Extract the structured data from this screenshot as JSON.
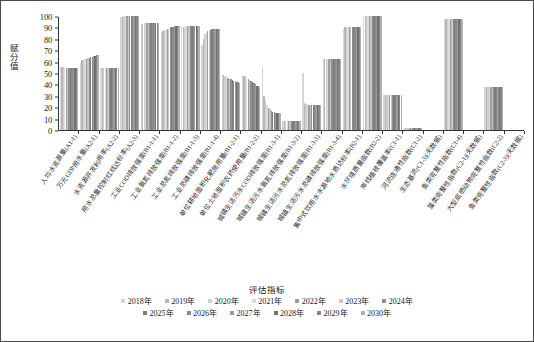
{
  "chart_data": {
    "type": "bar",
    "title": "",
    "xlabel": "评估指标",
    "ylabel": "赋分值",
    "ylim": [
      0,
      100
    ],
    "yticks": [
      0,
      10,
      20,
      30,
      40,
      50,
      60,
      70,
      80,
      90,
      100
    ],
    "grid": false,
    "legend_title": "评估指标",
    "legend_position": "bottom",
    "categories": [
      "人均水资源量(A1-1)",
      "万元GDP用水量(A2-1)",
      "水资源开发利用率(A2-2)",
      "用水总量控制红线达标率(A2-3)",
      "工业COD排放强度(B1-1-1)",
      "工业氨氮排放强度(B1-1-2)",
      "工业总氮排放强度(B1-1-3)",
      "工业总磷排放强度(B1-1-4)",
      "单位耕地面积化肥施用量(B1-2-1)",
      "单位土地面积农药使用量(B1-2-2)",
      "城镇生活污水COD排放强度(B1-3-1)",
      "城镇生活污水氨氮排放强度(B1-3-2)",
      "城镇生活污水总氮排放强度(B1-3-3)",
      "城镇生活污水总磷排放强度(B1-3-4)",
      "集中式饮用水水源地水质达标率(B2-1)",
      "水环境质量指数(B2-2)",
      "岸线植被覆盖率(C1-1)",
      "河流连通性指数(C1-2)",
      "生态基流(C1-3)(无数据)",
      "鱼类完整性指数(C1-4)",
      "藻类完整性指数(C2-1)(无数据)",
      "大型底栖动物完整性指数(C2-2)",
      "鱼类完整性指数(C2-3)(无数据)"
    ],
    "series": [
      {
        "name": "2018年",
        "color": "#d6d6d6",
        "values": [
          55,
          60,
          54,
          99,
          93,
          86,
          90,
          75,
          48,
          48,
          55,
          8,
          50,
          62,
          89,
          99,
          31,
          2,
          0,
          97,
          0,
          38,
          0
        ]
      },
      {
        "name": "2019年",
        "color": "#b8b8b8",
        "values": [
          55,
          61,
          54,
          99,
          93,
          87,
          90,
          80,
          48,
          47,
          30,
          8,
          24,
          62,
          90,
          100,
          31,
          2,
          0,
          97,
          0,
          38,
          0
        ]
      },
      {
        "name": "2020年",
        "color": "#cfcfcf",
        "values": [
          55,
          61,
          54,
          100,
          94,
          88,
          90,
          84,
          47,
          47,
          26,
          8,
          23,
          62,
          90,
          100,
          31,
          2,
          0,
          97,
          0,
          38,
          0
        ]
      },
      {
        "name": "2021年",
        "color": "#dcdcdc",
        "values": [
          54,
          62,
          54,
          100,
          94,
          88,
          91,
          86,
          47,
          46,
          22,
          8,
          23,
          62,
          90,
          100,
          31,
          2,
          0,
          97,
          0,
          38,
          0
        ]
      },
      {
        "name": "2022年",
        "color": "#9e9e9e",
        "values": [
          54,
          62,
          54,
          100,
          94,
          89,
          91,
          87,
          46,
          45,
          19,
          8,
          22,
          62,
          90,
          100,
          31,
          2,
          0,
          97,
          0,
          38,
          0
        ]
      },
      {
        "name": "2023年",
        "color": "#c6c6c6",
        "values": [
          54,
          63,
          54,
          100,
          94,
          89,
          91,
          88,
          45,
          44,
          18,
          8,
          22,
          62,
          90,
          100,
          31,
          2,
          0,
          97,
          0,
          38,
          0
        ]
      },
      {
        "name": "2024年",
        "color": "#8f8f8f",
        "values": [
          54,
          63,
          54,
          100,
          94,
          90,
          91,
          88,
          45,
          43,
          17,
          8,
          22,
          62,
          90,
          100,
          31,
          2,
          0,
          97,
          0,
          38,
          0
        ]
      },
      {
        "name": "2025年",
        "color": "#7d7d7d",
        "values": [
          54,
          64,
          54,
          100,
          94,
          90,
          91,
          89,
          44,
          42,
          16,
          8,
          22,
          62,
          90,
          100,
          31,
          2,
          0,
          97,
          0,
          38,
          0
        ]
      },
      {
        "name": "2026年",
        "color": "#8a8a8a",
        "values": [
          54,
          64,
          54,
          100,
          94,
          90,
          91,
          89,
          43,
          41,
          16,
          8,
          22,
          62,
          90,
          100,
          31,
          2,
          0,
          97,
          0,
          38,
          0
        ]
      },
      {
        "name": "2027年",
        "color": "#9a9a9a",
        "values": [
          54,
          65,
          54,
          100,
          94,
          91,
          91,
          89,
          43,
          40,
          15,
          8,
          22,
          62,
          90,
          100,
          31,
          2,
          0,
          97,
          0,
          38,
          0
        ]
      },
      {
        "name": "2028年",
        "color": "#717171",
        "values": [
          54,
          65,
          54,
          100,
          94,
          91,
          91,
          89,
          42,
          39,
          15,
          8,
          22,
          62,
          90,
          100,
          31,
          2,
          0,
          97,
          0,
          38,
          0
        ]
      },
      {
        "name": "2029年",
        "color": "#868686",
        "values": [
          54,
          66,
          54,
          100,
          94,
          91,
          91,
          89,
          42,
          39,
          15,
          8,
          22,
          62,
          90,
          100,
          31,
          2,
          0,
          97,
          0,
          38,
          0
        ]
      },
      {
        "name": "2030年",
        "color": "#b0b0b0",
        "values": [
          54,
          66,
          54,
          100,
          94,
          91,
          91,
          89,
          41,
          38,
          15,
          8,
          22,
          62,
          90,
          100,
          31,
          2,
          0,
          97,
          0,
          38,
          0
        ]
      }
    ]
  }
}
